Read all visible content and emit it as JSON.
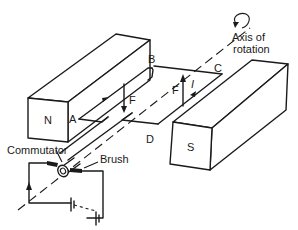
{
  "diagram": {
    "magnets": {
      "north": {
        "label": "N"
      },
      "south": {
        "label": "S"
      }
    },
    "coil": {
      "corners": {
        "a": "A",
        "b": "B",
        "c": "C",
        "d": "D"
      }
    },
    "forces": {
      "left_side": "F",
      "right_side": "F"
    },
    "current": {
      "label": "I"
    },
    "annotations": {
      "axis_line1": "Axis of",
      "axis_line2": "rotation",
      "commutator": "Commutator",
      "brush": "Brush"
    },
    "colors": {
      "ink": "#1a1a1a",
      "background": "#ffffff"
    }
  }
}
